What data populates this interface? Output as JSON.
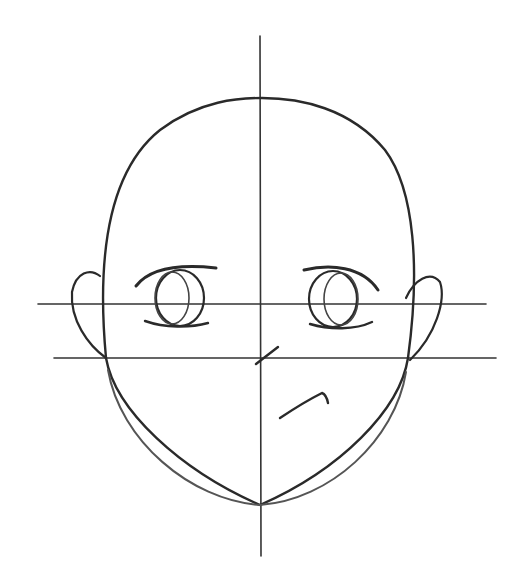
{
  "image": {
    "subject": "pencil sketch of anime head construction",
    "background": "#ffffff",
    "stroke_color": "#2a2a2a",
    "guide_color": "#333333"
  },
  "guides": {
    "vertical_center_x": 260,
    "eye_line_y": 304,
    "nose_line_y": 358
  },
  "features": [
    "head-outline",
    "left-eye",
    "right-eye",
    "left-ear",
    "right-ear",
    "nose-mark",
    "mouth-mark",
    "chin-lines"
  ]
}
